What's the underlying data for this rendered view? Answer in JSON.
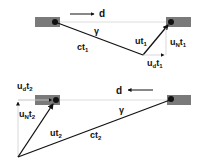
{
  "diagram": {
    "top": {
      "direction_label": "d",
      "direction": "right",
      "angle_label": "γ",
      "vectors": [
        {
          "id": "ct1",
          "label_main": "ct",
          "label_sub": "1"
        },
        {
          "id": "ut1",
          "label_main": "ut",
          "label_sub": "1"
        },
        {
          "id": "uNt1",
          "label_main": "u",
          "label_mid": "N",
          "label_main2": "t",
          "label_sub": "1"
        },
        {
          "id": "udt1",
          "label_main": "u",
          "label_mid": "d",
          "label_main2": "t",
          "label_sub": "1"
        }
      ]
    },
    "bottom": {
      "direction_label": "d",
      "direction": "left",
      "angle_label": "γ",
      "vectors": [
        {
          "id": "ct2",
          "label_main": "ct",
          "label_sub": "2"
        },
        {
          "id": "ut2",
          "label_main": "ut",
          "label_sub": "2"
        },
        {
          "id": "uNt2",
          "label_main": "u",
          "label_mid": "N",
          "label_main2": "t",
          "label_sub": "2"
        },
        {
          "id": "udt2",
          "label_main": "u",
          "label_mid": "d",
          "label_main2": "t",
          "label_sub": "2"
        }
      ]
    },
    "colors": {
      "bar": "#7a7a7a",
      "line": "#111111",
      "guide": "#cccccc"
    }
  }
}
